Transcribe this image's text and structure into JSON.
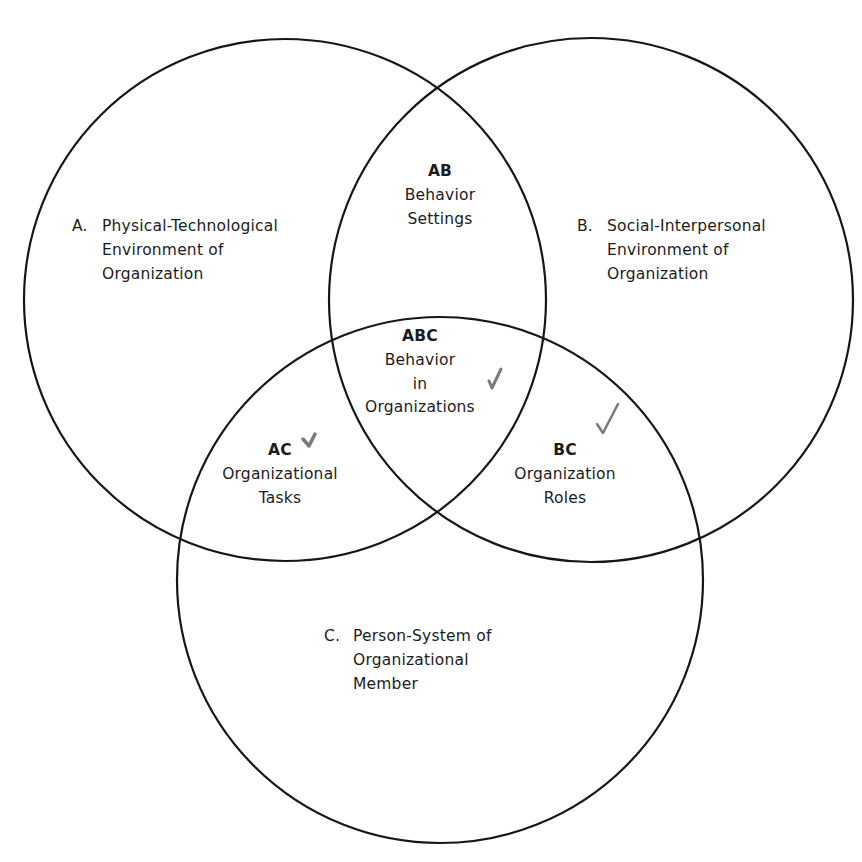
{
  "diagram": {
    "type": "venn",
    "circles": [
      {
        "id": "A",
        "cx": 285,
        "cy": 300,
        "r": 261
      },
      {
        "id": "B",
        "cx": 591,
        "cy": 300,
        "r": 262
      },
      {
        "id": "C",
        "cx": 440,
        "cy": 580,
        "r": 263
      }
    ],
    "sets": {
      "A": {
        "letter": "A.",
        "lines": [
          "Physical-Technological",
          "Environment of",
          "Organization"
        ]
      },
      "B": {
        "letter": "B.",
        "lines": [
          "Social-Interpersonal",
          "Environment of",
          "Organization"
        ]
      },
      "C": {
        "letter": "C.",
        "lines": [
          "Person-System of",
          "Organizational",
          "Member"
        ]
      }
    },
    "intersections": {
      "AB": {
        "code": "AB",
        "lines": [
          "Behavior",
          "Settings"
        ]
      },
      "ABC": {
        "code": "ABC",
        "lines": [
          "Behavior",
          "in",
          "Organizations"
        ],
        "checked": true
      },
      "AC": {
        "code": "AC",
        "lines": [
          "Organizational",
          "Tasks"
        ],
        "checked": true
      },
      "BC": {
        "code": "BC",
        "lines": [
          "Organization",
          "Roles"
        ],
        "checked": true
      }
    },
    "colors": {
      "stroke": "#161616",
      "text": "#1c1c1c",
      "check": "#7a7a7a"
    }
  }
}
